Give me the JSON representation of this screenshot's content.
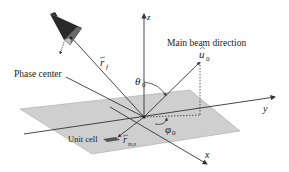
{
  "diagram": {
    "labels": {
      "phase_center": "Phase center",
      "main_beam": "Main beam direction",
      "unit_cell": "Unit cell",
      "r_f": "r",
      "r_f_sub": "f",
      "u0": "u",
      "u0_sub": "0",
      "theta0": "θ",
      "theta0_sub": "0",
      "phi0": "φ",
      "phi0_sub": "0",
      "r_mn": "r",
      "r_mn_sub": "m,n",
      "axis_x": "x",
      "axis_y": "y",
      "axis_z": "z"
    },
    "colors": {
      "plane": "#cfcfcf",
      "line": "#333333",
      "horn_dark": "#2a2a2a",
      "horn_mid": "#6a6a6a",
      "horn_light": "#bdbdbd"
    }
  }
}
